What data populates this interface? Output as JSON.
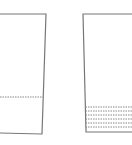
{
  "diagram": {
    "colors": {
      "stroke": "#777777",
      "dashed": "#888888",
      "background": "#ffffff"
    },
    "shapes": [
      {
        "id": "left-vessel",
        "points": [
          [
            0,
            14
          ],
          [
            46,
            14
          ],
          [
            42,
            134
          ],
          [
            0,
            133
          ]
        ],
        "dashed_lines_y": [
          97
        ]
      },
      {
        "id": "right-vessel",
        "points": [
          [
            132,
            14
          ],
          [
            83,
            14
          ],
          [
            86,
            132
          ],
          [
            132,
            132
          ]
        ],
        "dashed_lines_y": [
          107,
          111,
          115,
          119,
          123,
          127
        ]
      }
    ]
  }
}
